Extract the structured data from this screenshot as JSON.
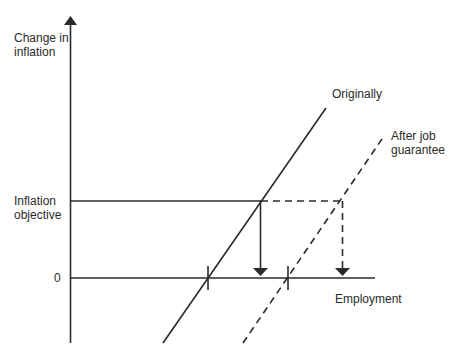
{
  "diagram": {
    "y_axis_label_line1": "Change in",
    "y_axis_label_line2": "inflation",
    "x_axis_label": "Employment",
    "inflation_objective_line1": "Inflation",
    "inflation_objective_line2": "objective",
    "zero_label": "0",
    "curve_original_label": "Originally",
    "curve_after_label_line1": "After job",
    "curve_after_label_line2": "guarantee"
  }
}
